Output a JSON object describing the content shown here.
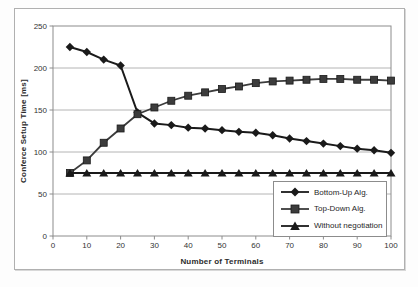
{
  "chart_data": {
    "type": "line",
    "title": "",
    "xlabel": "Number of Terminals",
    "ylabel": "Conferce Setup Time [ms]",
    "xlim": [
      0,
      100
    ],
    "ylim": [
      0,
      250
    ],
    "x_ticks": [
      0,
      10,
      20,
      30,
      40,
      50,
      60,
      70,
      80,
      90,
      100
    ],
    "y_ticks": [
      0,
      50,
      100,
      150,
      200,
      250
    ],
    "grid": "horizontal",
    "legend_position": "inside-bottom-right",
    "x": [
      5,
      10,
      15,
      20,
      25,
      30,
      35,
      40,
      45,
      50,
      55,
      60,
      65,
      70,
      75,
      80,
      85,
      90,
      95,
      100
    ],
    "series": [
      {
        "name": "Bottom-Up Alg.",
        "marker": "diamond",
        "color": "#1a1a1a",
        "values": [
          225,
          219,
          210,
          203,
          147,
          134,
          132,
          129,
          128,
          126,
          124,
          123,
          120,
          116,
          113,
          110,
          107,
          104,
          102,
          99
        ]
      },
      {
        "name": "Top-Down Alg.",
        "marker": "square",
        "color": "#3c3c3c",
        "values": [
          75,
          90,
          111,
          128,
          145,
          153,
          161,
          167,
          171,
          175,
          178,
          182,
          184,
          185,
          186,
          187,
          187,
          186,
          186,
          185
        ]
      },
      {
        "name": "Without negotiation",
        "marker": "triangle",
        "color": "#1a1a1a",
        "values": [
          75,
          75,
          75,
          75,
          75,
          75,
          75,
          75,
          75,
          75,
          75,
          75,
          75,
          75,
          75,
          75,
          75,
          75,
          75,
          75
        ]
      }
    ],
    "colors": {
      "gridline": "#b4b4b4",
      "plot_border": "#8c8c8c",
      "tick_text": "#333333"
    }
  }
}
